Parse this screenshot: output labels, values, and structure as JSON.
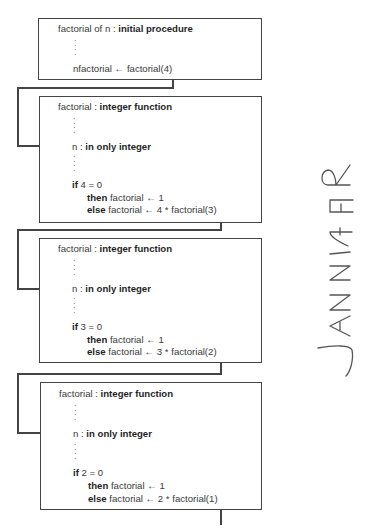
{
  "diagram": {
    "procedure": {
      "header_name": "factorial of n",
      "header_sep": " : ",
      "header_kind": "initial procedure",
      "call_lhs": "nfactorial",
      "arrow": "←",
      "call_rhs": "factorial(4)"
    },
    "frames": [
      {
        "header_name": "factorial",
        "header_sep": " : ",
        "header_kind": "integer function",
        "param_name": "n",
        "param_sep": " : ",
        "param_kind": "in only integer",
        "if_kw": "if",
        "if_cond": " 4 = 0",
        "then_kw": "then",
        "then_stmt": " factorial ← 1",
        "else_kw": "else",
        "else_stmt": "  factorial ← 4 * factorial(3)"
      },
      {
        "header_name": "factorial",
        "header_sep": " : ",
        "header_kind": "integer function",
        "param_name": "n",
        "param_sep": " : ",
        "param_kind": "in only integer",
        "if_kw": "if",
        "if_cond": " 3 = 0",
        "then_kw": "then",
        "then_stmt": " factorial ← 1",
        "else_kw": "else",
        "else_stmt": "  factorial ← 3 * factorial(2)"
      },
      {
        "header_name": "factorial",
        "header_sep": " : ",
        "header_kind": "integer function",
        "param_name": "n",
        "param_sep": " : ",
        "param_kind": "in only integer",
        "if_kw": "if",
        "if_cond": " 2 = 0",
        "then_kw": "then",
        "then_stmt": " factorial ← 1",
        "else_kw": "else",
        "else_stmt": "  factorial ← 2 * factorial(1)"
      }
    ],
    "handwriting": "JANNIFER"
  }
}
